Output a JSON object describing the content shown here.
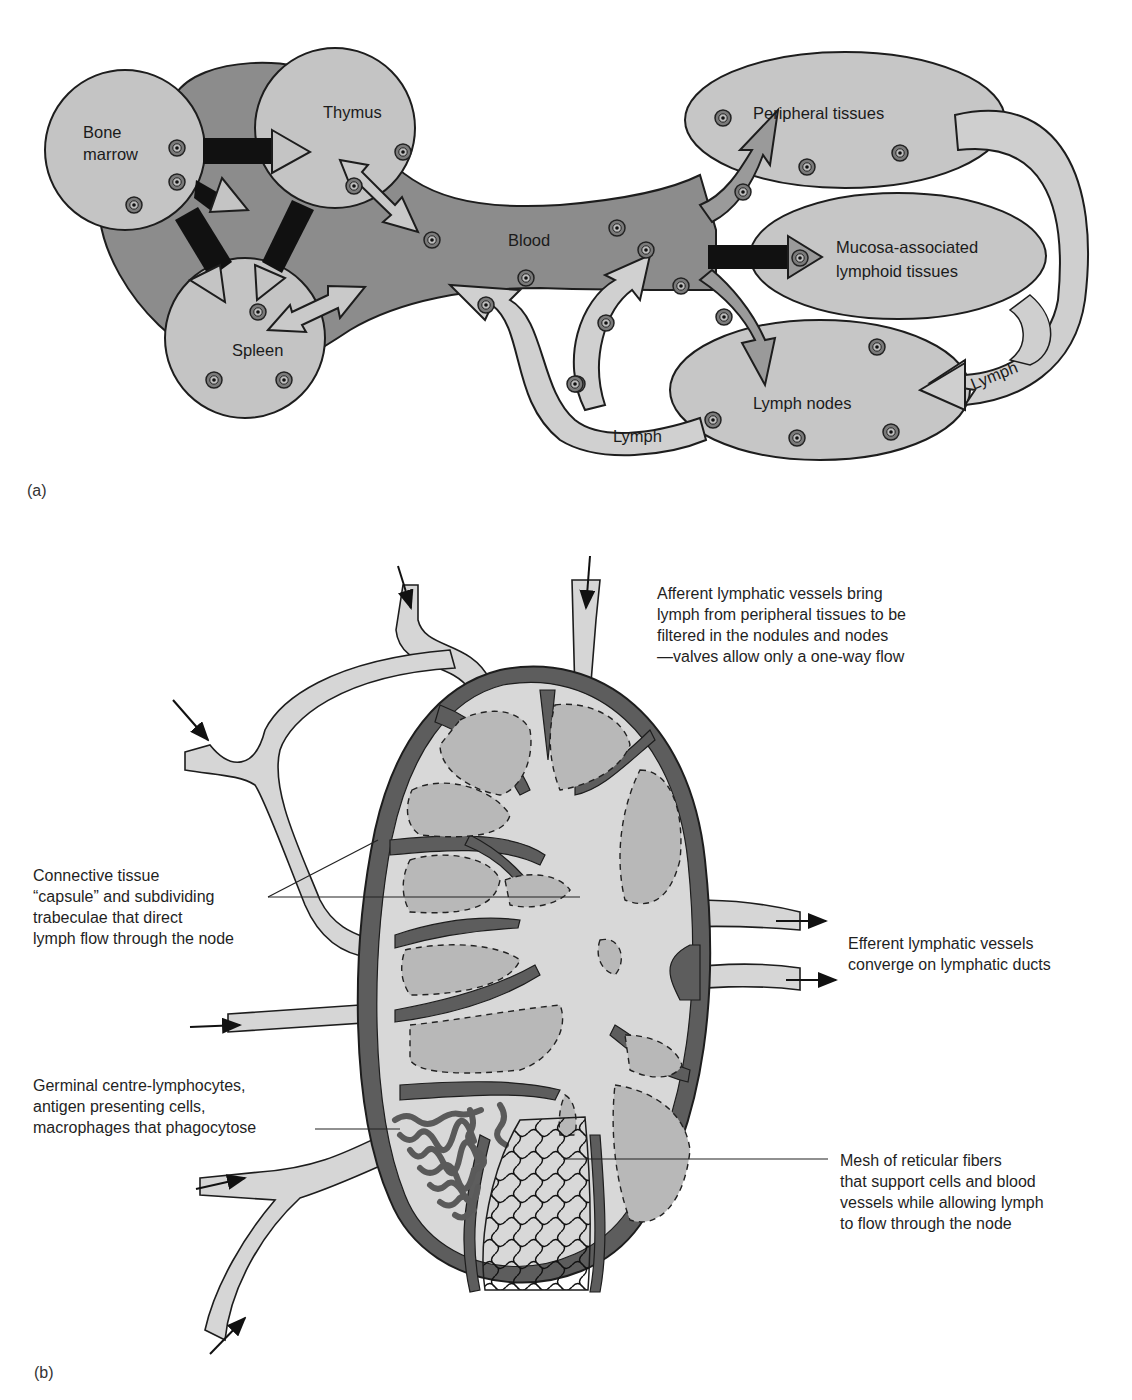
{
  "figure": {
    "panel_a": {
      "tag": "(a)",
      "organs": {
        "bone_marrow": [
          "Bone",
          "marrow"
        ],
        "thymus": "Thymus",
        "spleen": "Spleen",
        "blood": "Blood",
        "peripheral": "Peripheral tissues",
        "malt": [
          "Mucosa-associated",
          "lymphoid tissues"
        ],
        "lymph_nodes": "Lymph nodes",
        "lymph_label_bottom": "Lymph",
        "lymph_label_right": "Lymph"
      }
    },
    "panel_b": {
      "tag": "(b)",
      "labels": {
        "afferent": [
          "Afferent lymphatic vessels bring",
          "lymph from peripheral tissues to be",
          "filtered in the nodules and nodes",
          "—valves allow only a one-way flow"
        ],
        "capsule": [
          "Connective tissue",
          "“capsule” and subdividing",
          "trabeculae that direct",
          "lymph flow through the node"
        ],
        "efferent": [
          "Efferent lymphatic vessels",
          "converge on lymphatic ducts"
        ],
        "germinal": [
          "Germinal centre-lymphocytes,",
          "antigen presenting cells,",
          "macrophages that phagocytose"
        ],
        "mesh": [
          "Mesh of reticular fibers",
          "that support cells and blood",
          "vessels while allowing lymph",
          "to flow through the node"
        ]
      }
    },
    "colors": {
      "blood_dark": "#8a8a8a",
      "organ_light": "#c4c4c4",
      "lymph_light": "#d2d2d2",
      "capsule_dark": "#5e5e5e",
      "nodule": "#b9b9b9",
      "black": "#111111"
    }
  }
}
